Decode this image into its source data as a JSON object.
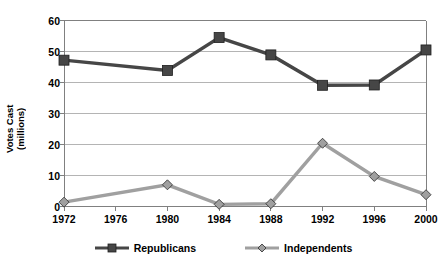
{
  "chart_data": {
    "type": "line",
    "title": "",
    "xlabel": "",
    "ylabel": "Votes Cast\n(millions)",
    "ylabel_line1": "Votes Cast",
    "ylabel_line2": "(millions)",
    "categories": [
      "1972",
      "1976",
      "1980",
      "1984",
      "1988",
      "1992",
      "1996",
      "2000"
    ],
    "xticks": [
      "1972",
      "1976",
      "1980",
      "1984",
      "1988",
      "1992",
      "1996",
      "2000"
    ],
    "yticks": [
      "0",
      "10",
      "20",
      "30",
      "40",
      "50",
      "60"
    ],
    "ylim": [
      0,
      60
    ],
    "grid": "horizontal",
    "legend_position": "bottom",
    "series": [
      {
        "name": "Republicans",
        "color": "#464646",
        "marker": "square",
        "x": [
          "1972",
          "1980",
          "1984",
          "1988",
          "1992",
          "1996",
          "2000"
        ],
        "values": [
          47.2,
          43.9,
          54.5,
          48.9,
          39.1,
          39.2,
          50.5
        ]
      },
      {
        "name": "Independents",
        "color": "#a0a0a0",
        "marker": "diamond",
        "x": [
          "1972",
          "1980",
          "1984",
          "1988",
          "1992",
          "1996",
          "2000"
        ],
        "values": [
          1.4,
          7.0,
          0.7,
          0.9,
          20.4,
          9.7,
          3.8
        ]
      }
    ]
  },
  "legend": {
    "items": [
      {
        "label": "Republicans",
        "color": "#464646",
        "marker": "square"
      },
      {
        "label": "Independents",
        "color": "#a0a0a0",
        "marker": "diamond"
      }
    ]
  },
  "colors": {
    "republicans": "#464646",
    "independents": "#a0a0a0",
    "gridline": "#b4b4b4",
    "axis": "#808080",
    "text": "#000000",
    "background": "#ffffff"
  }
}
